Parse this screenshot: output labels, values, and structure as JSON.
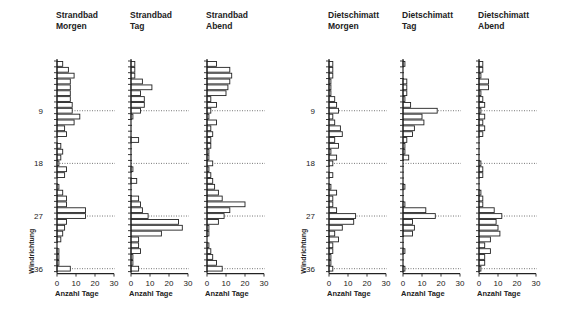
{
  "chart_data": {
    "type": "bar",
    "orientation": "horizontal",
    "ylabel": "Windrichtung",
    "xlabel": "Anzahl Tage",
    "x_ticks": [
      0,
      10,
      20,
      30
    ],
    "xlim": [
      0,
      30
    ],
    "y_ticks": [
      9,
      18,
      27,
      36
    ],
    "directions": [
      1,
      2,
      3,
      4,
      5,
      6,
      7,
      8,
      9,
      10,
      11,
      12,
      13,
      14,
      15,
      16,
      17,
      18,
      19,
      20,
      21,
      22,
      23,
      24,
      25,
      26,
      27,
      28,
      29,
      30,
      31,
      32,
      33,
      34,
      35,
      36
    ],
    "grid": "dotted reference lines at directions 9, 18, 27, 36",
    "panels": [
      {
        "name": "Strandbad Morgen",
        "title": [
          "Strandbad",
          "Morgen"
        ],
        "values": [
          3,
          6,
          9,
          7,
          7,
          7,
          7,
          8,
          8,
          12,
          9,
          4,
          5,
          0,
          2,
          3,
          2,
          1,
          5,
          4,
          0,
          1,
          3,
          5,
          5,
          15,
          15,
          5,
          4,
          3,
          2,
          0,
          1,
          1,
          1,
          7
        ]
      },
      {
        "name": "Strandbad Tag",
        "title": [
          "Strandbad",
          "Tag"
        ],
        "values": [
          2,
          2,
          2,
          6,
          11,
          5,
          7,
          7,
          5,
          1,
          0,
          0,
          0,
          4,
          0,
          0,
          0,
          0,
          1,
          0,
          3,
          0,
          0,
          4,
          5,
          6,
          9,
          25,
          27,
          16,
          4,
          4,
          5,
          1,
          1,
          4
        ]
      },
      {
        "name": "Strandbad Abend",
        "title": [
          "Strandbad",
          "Abend"
        ],
        "values": [
          5,
          12,
          13,
          12,
          11,
          10,
          2,
          5,
          2,
          1,
          5,
          2,
          3,
          2,
          2,
          1,
          1,
          3,
          1,
          2,
          3,
          4,
          6,
          8,
          20,
          12,
          9,
          6,
          1,
          1,
          0,
          1,
          2,
          3,
          5,
          8
        ]
      },
      {
        "name": "Dietschimatt Morgen",
        "title": [
          "Dietschimatt",
          "Morgen"
        ],
        "values": [
          2,
          2,
          2,
          1,
          1,
          1,
          3,
          4,
          5,
          2,
          3,
          6,
          7,
          3,
          5,
          1,
          4,
          2,
          0,
          2,
          0,
          1,
          4,
          2,
          2,
          4,
          14,
          13,
          7,
          3,
          5,
          2,
          2,
          1,
          1,
          2
        ]
      },
      {
        "name": "Dietschimatt Tag",
        "title": [
          "Dietschimatt",
          "Tag"
        ],
        "values": [
          1,
          0,
          0,
          2,
          2,
          2,
          1,
          4,
          18,
          10,
          11,
          6,
          5,
          2,
          1,
          1,
          3,
          0,
          0,
          0,
          0,
          1,
          0,
          0,
          1,
          12,
          17,
          5,
          6,
          5,
          0,
          0,
          1,
          0,
          0,
          1
        ]
      },
      {
        "name": "Dietschimatt Abend",
        "title": [
          "Dietschimatt",
          "Abend"
        ],
        "values": [
          2,
          2,
          1,
          5,
          5,
          1,
          2,
          3,
          1,
          3,
          2,
          3,
          2,
          0,
          0,
          0,
          0,
          1,
          2,
          2,
          0,
          0,
          1,
          2,
          2,
          8,
          12,
          9,
          10,
          11,
          6,
          3,
          6,
          3,
          3,
          1
        ]
      }
    ]
  }
}
